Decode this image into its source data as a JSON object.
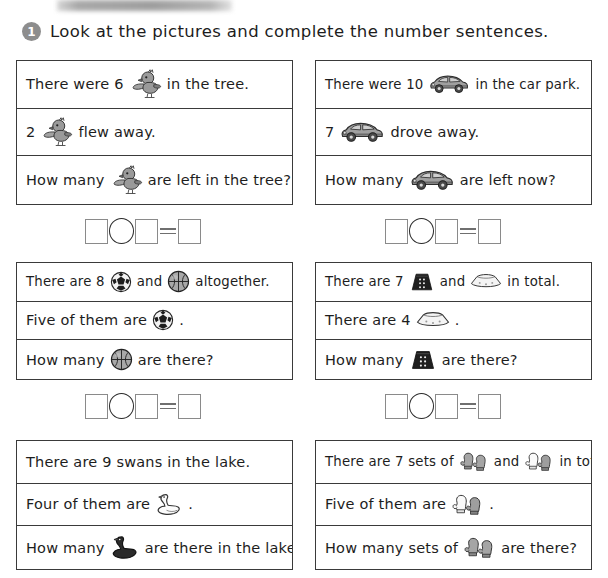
{
  "header": {
    "number_badge": "1",
    "instruction": "Look at the pictures and complete the number sentences.",
    "top_banner": "blurred-cropped-text"
  },
  "questions": [
    {
      "id": "q1-birds",
      "lines": [
        {
          "before": "There were 6",
          "icon": "bird-icon",
          "after": "in the tree."
        },
        {
          "before": "2",
          "icon": "bird-icon",
          "after": "flew away."
        },
        {
          "before": "How many",
          "icon": "bird-icon",
          "after": "are left in the tree?"
        }
      ]
    },
    {
      "id": "q2-cars",
      "lines": [
        {
          "before": "There were 10",
          "icon": "car-icon",
          "after": "in the car park."
        },
        {
          "before": "7",
          "icon": "car-icon",
          "after": "drove away."
        },
        {
          "before": "How many",
          "icon": "car-icon",
          "after": "are left now?"
        }
      ]
    },
    {
      "id": "q3-balls",
      "lines": [
        {
          "before": "There are 8",
          "icon": "soccer-ball-icon",
          "mid": "and",
          "icon2": "basketball-icon",
          "after": "altogether."
        },
        {
          "before": "Five of them are",
          "icon": "soccer-ball-icon",
          "after": "."
        },
        {
          "before": "How many",
          "icon": "basketball-icon",
          "after": "are there?"
        }
      ]
    },
    {
      "id": "q4-skirts",
      "lines": [
        {
          "before": "There are 7",
          "icon": "dark-skirt-icon",
          "mid": "and",
          "icon2": "light-skirt-icon",
          "after": "in total."
        },
        {
          "before": "There are 4",
          "icon": "light-skirt-icon",
          "after": "."
        },
        {
          "before": "How many",
          "icon": "dark-skirt-icon",
          "after": "are there?"
        }
      ]
    },
    {
      "id": "q5-swans",
      "lines": [
        {
          "before": "There are 9 swans in the lake.",
          "icon": "",
          "after": ""
        },
        {
          "before": "Four of them are",
          "icon": "white-swan-icon",
          "after": "."
        },
        {
          "before": "How many",
          "icon": "dark-swan-icon",
          "after": "are there in the lake?"
        }
      ]
    },
    {
      "id": "q6-mittens",
      "lines": [
        {
          "before": "There are 7 sets of",
          "icon": "gray-mitten-pair-icon",
          "mid": "and",
          "icon2": "white-mitten-pair-icon",
          "after": "in total."
        },
        {
          "before": "Five of them are",
          "icon": "white-mitten-pair-icon",
          "after": "."
        },
        {
          "before": "How many sets of",
          "icon": "gray-mitten-pair-icon",
          "after": "are there?"
        }
      ]
    }
  ],
  "answer_rows": [
    {
      "id": "answer-row-1",
      "cells": [
        "square",
        "circle",
        "square",
        "equals",
        "square"
      ]
    },
    {
      "id": "answer-row-2",
      "cells": [
        "square",
        "circle",
        "square",
        "equals",
        "square"
      ]
    }
  ],
  "colors": {
    "border": "#3a3a3a",
    "text": "#1d1d1d",
    "badge": "#8d8d8d",
    "icon_gray": "#8f8f8f",
    "icon_dark": "#222222"
  }
}
